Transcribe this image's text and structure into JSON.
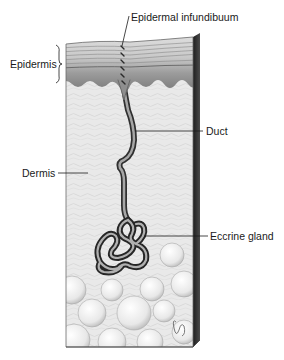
{
  "diagram": {
    "labels": {
      "epidermal_infundibuum": "Epidermal infundibuum",
      "epidermis": "Epidermis",
      "duct": "Duct",
      "dermis": "Dermis",
      "eccrine_gland": "Eccrine gland"
    },
    "signature": "OG",
    "colors": {
      "background": "#ffffff",
      "epidermis_light": "#d9d9d9",
      "epidermis_dark": "#8c8c8c",
      "dermis": "#e6e6e6",
      "block_side": "#2b2b2b",
      "duct_outline": "#333333",
      "duct_fill": "#9a9a9a",
      "fat_globule": "#efefef",
      "leader_line": "#1a1a1a"
    }
  }
}
